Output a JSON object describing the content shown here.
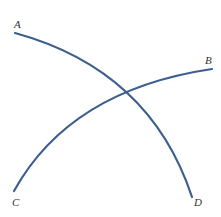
{
  "diagram": {
    "type": "intersecting-arcs",
    "stroke_color": "#3d5f8f",
    "arcs": [
      {
        "name": "arc-A-D",
        "from": "A",
        "to": "D",
        "path": "M15 33 Q 150 70 192 197"
      },
      {
        "name": "arc-C-B",
        "from": "C",
        "to": "B",
        "path": "M14 191 Q 70 90 212 69"
      }
    ],
    "labels": {
      "A": "A",
      "B": "B",
      "C": "C",
      "D": "D"
    }
  }
}
